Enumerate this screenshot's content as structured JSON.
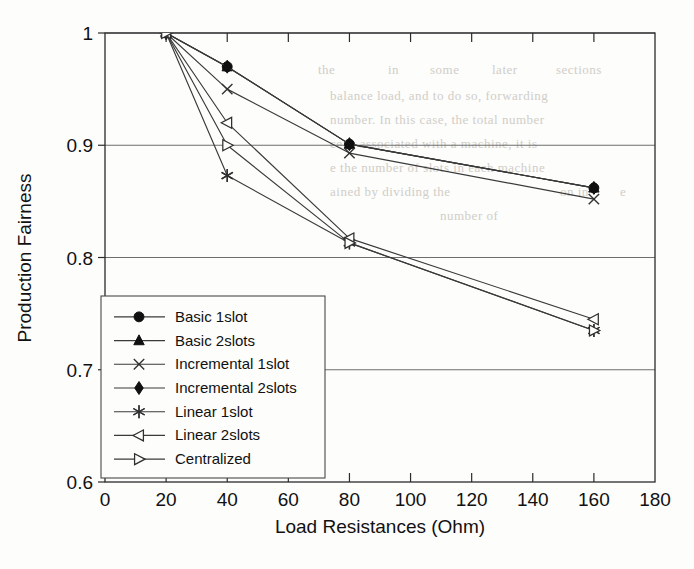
{
  "chart_data": {
    "type": "line",
    "title": "",
    "xlabel": "Load Resistances (Ohm)",
    "ylabel": "Production Fairness",
    "x": [
      20,
      40,
      80,
      160
    ],
    "xlim": [
      0,
      180
    ],
    "ylim": [
      0.6,
      1.0
    ],
    "xticks": [
      0,
      20,
      40,
      60,
      80,
      100,
      120,
      140,
      160,
      180
    ],
    "yticks": [
      0.6,
      0.7,
      0.8,
      0.9,
      1.0
    ],
    "xtick_labels": [
      "0",
      "20",
      "40",
      "60",
      "80",
      "100",
      "120",
      "140",
      "160",
      "180"
    ],
    "ytick_labels": [
      "0.6",
      "0.7",
      "0.8",
      "0.9",
      "1"
    ],
    "grid": "horizontal",
    "legend_position": "lower-left-inside",
    "series": [
      {
        "name": "Basic 1slot",
        "marker": "circle",
        "values": [
          1.0,
          0.97,
          0.901,
          0.862
        ]
      },
      {
        "name": "Basic 2slots",
        "marker": "triangle-up",
        "values": [
          1.0,
          0.97,
          0.901,
          0.862
        ]
      },
      {
        "name": "Incremental 1slot",
        "marker": "x-cross",
        "values": [
          1.0,
          0.95,
          0.893,
          0.852
        ]
      },
      {
        "name": "Incremental 2slots",
        "marker": "diamond",
        "values": [
          1.0,
          0.97,
          0.901,
          0.862
        ]
      },
      {
        "name": "Linear 1slot",
        "marker": "asterisk",
        "values": [
          1.0,
          0.873,
          0.813,
          0.735
        ]
      },
      {
        "name": "Linear 2slots",
        "marker": "triangle-left",
        "values": [
          1.0,
          0.92,
          0.817,
          0.745
        ]
      },
      {
        "name": "Centralized",
        "marker": "triangle-right",
        "values": [
          1.0,
          0.9,
          0.813,
          0.735
        ]
      }
    ]
  },
  "legend": {
    "entries": [
      "Basic 1slot",
      "Basic 2slots",
      "Incremental 1slot",
      "Incremental 2slots",
      "Linear 1slot",
      "Linear 2slots",
      "Centralized"
    ]
  },
  "scan_artifacts": {
    "bleed_lines": [
      "the",
      "in",
      "some",
      "later",
      "sections",
      "balance load, and to do so, forwarding",
      "number. In this case, the total number",
      "ce is associated with a machine, it is",
      "e the number of slots in each machine",
      "ained by dividing the",
      "on in",
      "e",
      "number of"
    ]
  }
}
